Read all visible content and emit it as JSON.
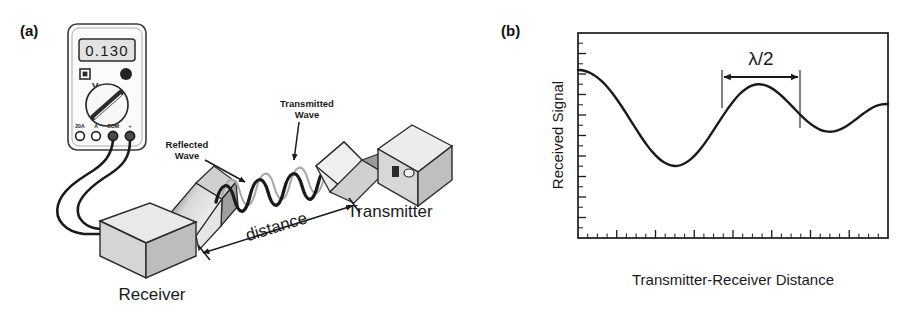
{
  "figure": {
    "panels": [
      {
        "id": "a",
        "label": "(a)",
        "instrument": {
          "name": "digital-multimeter",
          "display_value": "0.130",
          "terminals": [
            "20A",
            "A",
            "COM",
            "+"
          ],
          "dial_marker": "V"
        },
        "annotations": {
          "reflected_wave": "Reflected\nWave",
          "reflected_wave_line1": "Reflected",
          "reflected_wave_line2": "Wave",
          "transmitted_wave_line1": "Transmitted",
          "transmitted_wave_line2": "Wave",
          "distance": "distance",
          "transmitter": "Transmitter",
          "receiver": "Receiver"
        }
      },
      {
        "id": "b",
        "label": "(b)",
        "annotations": {
          "half_wavelength": "λ/2"
        }
      }
    ]
  },
  "chart_data": {
    "type": "line",
    "title": "",
    "xlabel": "Transmitter-Receiver Distance",
    "ylabel": "Received Signal",
    "xlim": [
      0,
      100
    ],
    "ylim": [
      0,
      100
    ],
    "grid": false,
    "legend": null,
    "axis_tick_labels_shown": false,
    "x_major_ticks": 8,
    "x_minor_per_major": 4,
    "y_major_ticks": 10,
    "y_minor_per_major": 2,
    "annotations": [
      {
        "text": "λ/2",
        "type": "double-arrow-span",
        "from_x": 46.5,
        "to_x": 71.5,
        "at_y": 88,
        "meaning": "separation between two consecutive signal maxima equals half a wavelength"
      }
    ],
    "series": [
      {
        "name": "Received Signal",
        "x": [
          0,
          2,
          4,
          6,
          8,
          10,
          12,
          14,
          16,
          18,
          20,
          22,
          24,
          26,
          28,
          30,
          32,
          34,
          36,
          38,
          40,
          42,
          44,
          46,
          48,
          50,
          52,
          54,
          56,
          58,
          60,
          62,
          64,
          66,
          68,
          70,
          72,
          74,
          76,
          78,
          80,
          82,
          84,
          86,
          88,
          90,
          92,
          94,
          96,
          98,
          100
        ],
        "y": [
          82,
          81.6,
          80.5,
          78.6,
          76,
          72.7,
          68.8,
          64.4,
          59.7,
          54.9,
          50.2,
          45.8,
          42,
          38.9,
          36.7,
          35.4,
          35.2,
          36.1,
          38,
          40.8,
          44.4,
          48.6,
          53.2,
          57.9,
          62.4,
          66.5,
          70,
          72.6,
          74.3,
          75,
          74.7,
          73.5,
          71.5,
          68.9,
          65.9,
          62.8,
          59.7,
          56.9,
          54.6,
          52.9,
          52,
          51.9,
          52.6,
          54,
          56,
          58.3,
          60.6,
          62.7,
          64.3,
          65.2,
          65.4
        ]
      }
    ]
  }
}
